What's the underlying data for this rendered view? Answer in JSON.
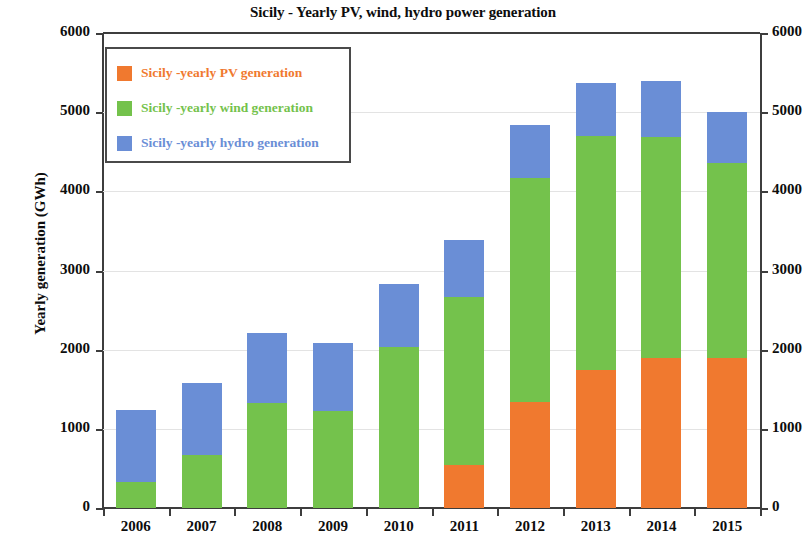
{
  "chart_data": {
    "type": "bar",
    "stacked": true,
    "title": "Sicily - Yearly PV, wind, hydro power generation",
    "xlabel": "",
    "ylabel": "Yearly generation (GWh)",
    "ylim": [
      0,
      6000
    ],
    "ytick_labels": [
      "0",
      "1000",
      "2000",
      "3000",
      "4000",
      "5000",
      "6000"
    ],
    "ytick_values": [
      0,
      1000,
      2000,
      3000,
      4000,
      5000,
      6000
    ],
    "grid": true,
    "legend_position": "upper left",
    "dual_y_axis": true,
    "right_axis_label": "",
    "right_ytick_labels": [
      "0",
      "1000",
      "2000",
      "3000",
      "4000",
      "5000",
      "6000"
    ],
    "categories": [
      "2006",
      "2007",
      "2008",
      "2009",
      "2010",
      "2011",
      "2012",
      "2013",
      "2014",
      "2015"
    ],
    "series": [
      {
        "name": "Sicily -yearly PV generation",
        "color": "#F0792F",
        "values": [
          0,
          0,
          0,
          0,
          0,
          540,
          1340,
          1740,
          1890,
          1890
        ]
      },
      {
        "name": "Sicily -yearly wind generation",
        "color": "#74C24C",
        "values": [
          330,
          670,
          1330,
          1230,
          2040,
          2120,
          2830,
          2960,
          2800,
          2470
        ]
      },
      {
        "name": "Sicily -yearly hydro generation",
        "color": "#6A8ED6",
        "values": [
          910,
          910,
          880,
          860,
          790,
          720,
          670,
          670,
          700,
          640
        ]
      }
    ],
    "totals": [
      1240,
      1580,
      2210,
      2090,
      2830,
      3380,
      4840,
      5370,
      5390,
      5000
    ]
  },
  "colors": {
    "pv": "#F0792F",
    "wind": "#74C24C",
    "hydro": "#6A8ED6",
    "axis": "#3d3d3d",
    "grid": "#e3e3e3",
    "text": "#0d0d0d"
  }
}
